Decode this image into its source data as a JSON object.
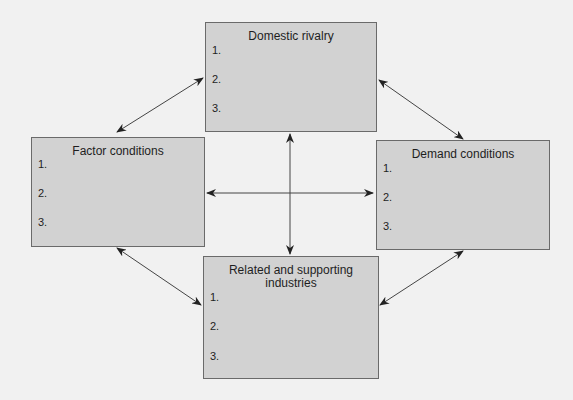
{
  "diagram": {
    "type": "Porter's Diamond",
    "colors": {
      "box_fill": "#d2d2d2",
      "box_border": "#6a6a6a",
      "arrow": "#333333",
      "background": "#f1f1f1"
    },
    "boxes": {
      "top": {
        "title": "Domestic rivalry",
        "items": [
          "1.",
          "2.",
          "3."
        ]
      },
      "left": {
        "title": "Factor conditions",
        "items": [
          "1.",
          "2.",
          "3."
        ]
      },
      "right": {
        "title": "Demand conditions",
        "items": [
          "1.",
          "2.",
          "3."
        ]
      },
      "bottom": {
        "title": "Related and supporting industries",
        "items": [
          "1.",
          "2.",
          "3."
        ]
      }
    },
    "connections": [
      {
        "from": "Domestic rivalry",
        "to": "Factor conditions",
        "type": "bidirectional"
      },
      {
        "from": "Domestic rivalry",
        "to": "Demand conditions",
        "type": "bidirectional"
      },
      {
        "from": "Factor conditions",
        "to": "Demand conditions",
        "type": "bidirectional"
      },
      {
        "from": "Domestic rivalry",
        "to": "Related and supporting industries",
        "type": "bidirectional"
      },
      {
        "from": "Factor conditions",
        "to": "Related and supporting industries",
        "type": "bidirectional"
      },
      {
        "from": "Demand conditions",
        "to": "Related and supporting industries",
        "type": "bidirectional"
      }
    ]
  }
}
